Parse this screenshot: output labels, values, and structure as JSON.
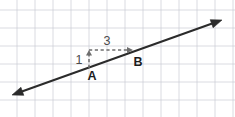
{
  "figure": {
    "kind": "coordinate-grid-line-diagram",
    "width": 235,
    "height": 117,
    "background_color": "#ffffff",
    "grid": {
      "color": "#c9ccd4",
      "spacing_px": 18,
      "x_lines": [
        17,
        35,
        53,
        71,
        89,
        107,
        125,
        143,
        161,
        179,
        197,
        215,
        233
      ],
      "y_lines": [
        10,
        28,
        46,
        64,
        82,
        100
      ]
    },
    "line": {
      "color": "#2b2b2b",
      "label": "line-AB",
      "start_x": 12,
      "start_y": 95,
      "end_x": 222,
      "end_y": 20,
      "double_headed": true
    },
    "points": [
      {
        "id": "A",
        "label": "A",
        "x": 89,
        "y": 68,
        "label_x": 92,
        "label_y": 80
      },
      {
        "id": "B",
        "label": "B",
        "x": 133,
        "y": 52,
        "label_x": 138,
        "label_y": 66
      }
    ],
    "slope_triangle": {
      "color": "#6d6d6d",
      "rise": {
        "label": "1",
        "from_x": 89,
        "from_y": 68,
        "to_x": 89,
        "to_y": 50,
        "label_x": 79,
        "label_y": 64
      },
      "run": {
        "label": "3",
        "from_x": 89,
        "from_y": 50,
        "to_x": 133,
        "to_y": 50,
        "label_x": 107,
        "label_y": 45
      }
    }
  }
}
